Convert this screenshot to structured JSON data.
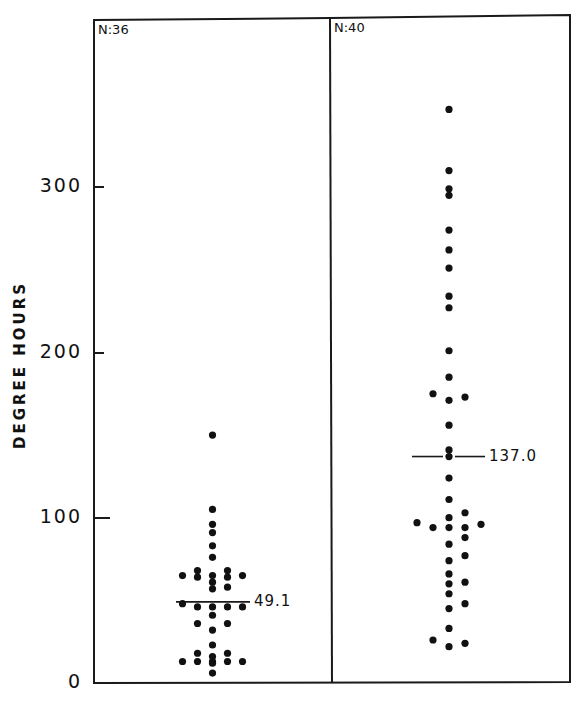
{
  "chart_data": {
    "type": "scatter",
    "subtype": "dot-strip-plot",
    "title": "",
    "xlabel": "",
    "ylabel": "DEGREE HOURS",
    "ylim": [
      0,
      350
    ],
    "yticks": [
      0,
      100,
      200,
      300
    ],
    "ytick_labels": [
      "0",
      "100",
      "200",
      "300"
    ],
    "grid": false,
    "legend": null,
    "panels": [
      {
        "name": "left",
        "n_label": "N:36",
        "n": 36,
        "mean": 49.1,
        "mean_label": "49.1",
        "points": [
          {
            "x": 0,
            "y": 150
          },
          {
            "x": 0,
            "y": 105
          },
          {
            "x": 0,
            "y": 96
          },
          {
            "x": 0,
            "y": 91
          },
          {
            "x": 0,
            "y": 83
          },
          {
            "x": 0,
            "y": 76
          },
          {
            "x": -2,
            "y": 65
          },
          {
            "x": -1,
            "y": 68
          },
          {
            "x": -1,
            "y": 64
          },
          {
            "x": 0,
            "y": 65
          },
          {
            "x": 0,
            "y": 61
          },
          {
            "x": 0,
            "y": 57
          },
          {
            "x": 1,
            "y": 68
          },
          {
            "x": 1,
            "y": 64
          },
          {
            "x": 1,
            "y": 58
          },
          {
            "x": 2,
            "y": 65
          },
          {
            "x": -2,
            "y": 48
          },
          {
            "x": -1,
            "y": 46
          },
          {
            "x": 0,
            "y": 46
          },
          {
            "x": 1,
            "y": 46
          },
          {
            "x": 2,
            "y": 46
          },
          {
            "x": 0,
            "y": 41
          },
          {
            "x": -1,
            "y": 36
          },
          {
            "x": 0,
            "y": 32
          },
          {
            "x": 1,
            "y": 36
          },
          {
            "x": 0,
            "y": 23
          },
          {
            "x": -1,
            "y": 18
          },
          {
            "x": -1,
            "y": 13
          },
          {
            "x": 0,
            "y": 16
          },
          {
            "x": 0,
            "y": 13
          },
          {
            "x": 0,
            "y": 12
          },
          {
            "x": 1,
            "y": 18
          },
          {
            "x": 1,
            "y": 13
          },
          {
            "x": -2,
            "y": 13
          },
          {
            "x": 2,
            "y": 13
          },
          {
            "x": 0,
            "y": 6
          }
        ]
      },
      {
        "name": "right",
        "n_label": "N:40",
        "n": 40,
        "mean": 137.0,
        "mean_label": "137.0",
        "points": [
          {
            "x": 0,
            "y": 347
          },
          {
            "x": 0,
            "y": 310
          },
          {
            "x": 0,
            "y": 299
          },
          {
            "x": 0,
            "y": 295
          },
          {
            "x": 0,
            "y": 274
          },
          {
            "x": 0,
            "y": 262
          },
          {
            "x": 0,
            "y": 251
          },
          {
            "x": 0,
            "y": 234
          },
          {
            "x": 0,
            "y": 227
          },
          {
            "x": 0,
            "y": 201
          },
          {
            "x": 0,
            "y": 185
          },
          {
            "x": -1,
            "y": 175
          },
          {
            "x": 1,
            "y": 173
          },
          {
            "x": 0,
            "y": 171
          },
          {
            "x": 0,
            "y": 156
          },
          {
            "x": 0,
            "y": 141
          },
          {
            "x": 0,
            "y": 137
          },
          {
            "x": 0,
            "y": 124
          },
          {
            "x": 0,
            "y": 111
          },
          {
            "x": 1,
            "y": 103
          },
          {
            "x": 0,
            "y": 100
          },
          {
            "x": -2,
            "y": 97
          },
          {
            "x": 2,
            "y": 96
          },
          {
            "x": -1,
            "y": 94
          },
          {
            "x": 0,
            "y": 94
          },
          {
            "x": 1,
            "y": 94
          },
          {
            "x": 1,
            "y": 88
          },
          {
            "x": 0,
            "y": 84
          },
          {
            "x": 1,
            "y": 77
          },
          {
            "x": 0,
            "y": 74
          },
          {
            "x": 0,
            "y": 66
          },
          {
            "x": 1,
            "y": 61
          },
          {
            "x": 0,
            "y": 60
          },
          {
            "x": 0,
            "y": 54
          },
          {
            "x": 1,
            "y": 48
          },
          {
            "x": 0,
            "y": 45
          },
          {
            "x": 0,
            "y": 33
          },
          {
            "x": -1,
            "y": 26
          },
          {
            "x": 1,
            "y": 24
          },
          {
            "x": 0,
            "y": 22
          }
        ]
      }
    ]
  },
  "labels": {
    "title_partial": "",
    "ylabel": "DEGREE HOURS",
    "ticks": {
      "t0": "0",
      "t100": "100",
      "t200": "200",
      "t300": "300"
    },
    "left_n": "N:36",
    "right_n": "N:40",
    "left_mean": "49.1",
    "right_mean": "137.0"
  }
}
